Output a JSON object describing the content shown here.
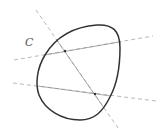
{
  "diagram": {
    "curve_label": "C",
    "colors": {
      "curve": "#333333",
      "lines": "#888888",
      "points": "#333333",
      "label": "#555555"
    },
    "lines": [
      {
        "name": "diagonal-line",
        "x1": 36,
        "y1": 10,
        "x2": 118,
        "y2": 128
      },
      {
        "name": "upper-line",
        "x1": 14,
        "y1": 60,
        "x2": 153,
        "y2": 36
      },
      {
        "name": "lower-line",
        "x1": 13,
        "y1": 83,
        "x2": 156,
        "y2": 101
      }
    ],
    "points": [
      {
        "name": "intersection-point-upper",
        "x": 65,
        "y": 51
      },
      {
        "name": "intersection-point-lower",
        "x": 95,
        "y": 94
      }
    ]
  }
}
